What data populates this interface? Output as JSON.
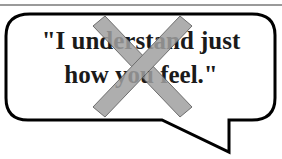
{
  "speech_bubble": {
    "line1": "\"I understand just",
    "line2": "how you feel.\"",
    "border_color": "#000000",
    "fill_color": "#ffffff"
  },
  "cross_mark": {
    "icon": "x-cross-icon",
    "color": "#a0a0a0",
    "outline": "#555555"
  }
}
